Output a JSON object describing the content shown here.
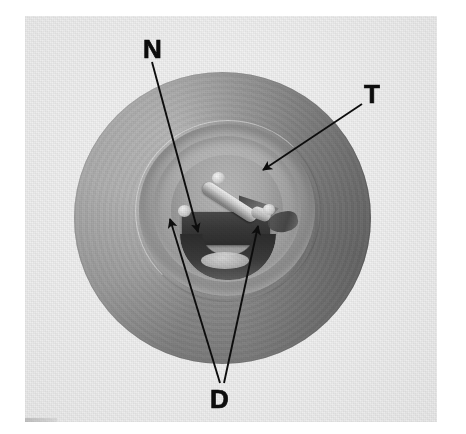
{
  "figure": {
    "kind": "grayscale-photograph",
    "background_color": "#ffffff",
    "plate_color": "#f1f1f1",
    "annotation_color": "#0d0d0d"
  },
  "labels": [
    {
      "id": "n",
      "text": "N",
      "meaning": "needle"
    },
    {
      "id": "t",
      "text": "T",
      "meaning": "taper-throat"
    },
    {
      "id": "d",
      "text": "D",
      "meaning": "deposits"
    }
  ],
  "leader_lines": [
    {
      "id": "n-leader",
      "from_label": "N",
      "x1": 152,
      "y1": 62,
      "x2": 198,
      "y2": 232,
      "arrowhead": "end"
    },
    {
      "id": "t-leader",
      "from_label": "T",
      "x1": 362,
      "y1": 104,
      "x2": 263,
      "y2": 170,
      "arrowhead": "end"
    },
    {
      "id": "d-leader-left",
      "from_label": "D",
      "x1": 220,
      "y1": 383,
      "x2": 170,
      "y2": 219,
      "arrowhead": "end"
    },
    {
      "id": "d-leader-right",
      "from_label": "D",
      "x1": 224,
      "y1": 383,
      "x2": 258,
      "y2": 226,
      "arrowhead": "end"
    }
  ],
  "parts": {
    "outer_disc": {
      "name": "outer flange",
      "tone": "#8d8d8d"
    },
    "taper_cone": {
      "name": "recessed taper",
      "tone": "#a8a8a8"
    },
    "bore_ring": {
      "name": "dark machined bore seat",
      "tone": "#2a2a2a"
    },
    "deposit_block": {
      "name": "dark deposit mass",
      "tone": "#383838"
    },
    "needle": {
      "name": "bright needle pin",
      "tone": "#dcdcdc"
    }
  }
}
